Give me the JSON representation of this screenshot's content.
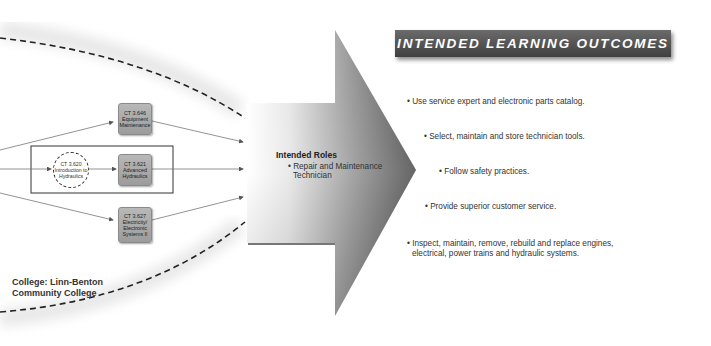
{
  "header": {
    "title": "INTENDED LEARNING OUTCOMES"
  },
  "courses": {
    "equipment": {
      "code": "CT 3.646",
      "lines": [
        "Equipment",
        "Maintenance"
      ]
    },
    "intro": {
      "code": "CT 3.620",
      "lines": [
        "Introduction to",
        "Hydraulics"
      ]
    },
    "advanced": {
      "code": "CT 3.621",
      "lines": [
        "Advanced",
        "Hydraulics"
      ]
    },
    "electricity": {
      "code": "CT 3.627",
      "lines": [
        "Electricity/",
        "Electronic",
        "Systems II"
      ]
    }
  },
  "college": {
    "line1": "College: Linn-Benton",
    "line2": "Community College"
  },
  "roles": {
    "title": "Intended Roles",
    "items": [
      "• Repair and Maintenance",
      "Technician"
    ]
  },
  "outcomes": [
    "• Use service expert and electronic parts catalog.",
    "• Select, maintain and store technician tools.",
    "• Follow safety practices.",
    "• Provide superior customer service.",
    "• Inspect, maintain, remove, rebuild and replace engines,",
    "electrical, power trains and hydraulic systems."
  ],
  "colors": {
    "header_bg": "#4f4f4f",
    "course_box": "#a8a8a8",
    "arrow_dark": "#555555"
  }
}
